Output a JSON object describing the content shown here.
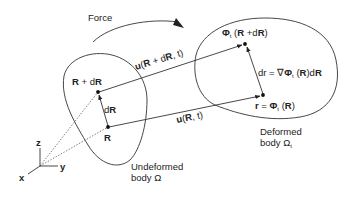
{
  "diagram": {
    "type": "continuum-mechanics-deformation",
    "force_label": "Force",
    "undeformed": {
      "label_line1": "Undeformed",
      "label_line2": "body Ω",
      "point_R_label": "R",
      "point_RdR_label": "R + dR",
      "vector_dR_label": "dR"
    },
    "deformed": {
      "label_line1": "Deformed",
      "label_line2": "body Ω",
      "label_line2_sub": "t",
      "point_r_label_prefix": "r = Φ",
      "point_r_sub": "t",
      "point_r_label_suffix": " (R)",
      "point_top_prefix": "Φ",
      "point_top_sub": "t",
      "point_top_suffix": " (R +dR)",
      "dr_prefix": "dr = ∇Φ",
      "dr_sub": "t",
      "dr_suffix": " (R)dR"
    },
    "displacements": {
      "top_prefix": "u",
      "top_args": "(R + dR, t)",
      "bottom_prefix": "u",
      "bottom_args": "(R, t)"
    },
    "axes": {
      "x": "x",
      "y": "y",
      "z": "z"
    },
    "colors": {
      "line": "#333333",
      "text": "#222222",
      "background": "#ffffff"
    }
  }
}
